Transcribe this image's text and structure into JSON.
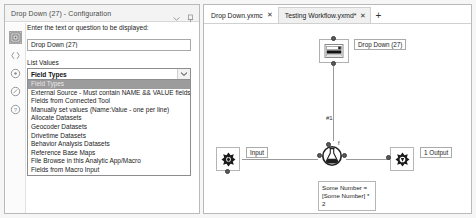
{
  "config_panel": {
    "header_title": "Drop Down (27) - Configuration",
    "header_icons": [
      "chevron-down-icon",
      "pin-icon"
    ],
    "rail_items": [
      {
        "name": "configuration-icon",
        "active": true
      },
      {
        "name": "annotation-icon",
        "active": false
      },
      {
        "name": "interface-designer-icon",
        "active": false
      },
      {
        "name": "output-icon",
        "active": false
      },
      {
        "name": "help-icon",
        "active": false
      }
    ],
    "prompt_label": "Enter the text or question to be displayed:",
    "prompt_value": "Drop Down (27)",
    "prompt_placeholder": "Enter the text or question to be displayed",
    "list_values_label": "List Values",
    "combo_selected": "Field Types",
    "combo_options": [
      "Field Types",
      "External Source - Must contain NAME && VALUE fields",
      "Fields from Connected Tool",
      "Manually set values (Name:Value - one per line)",
      "Allocate Datasets",
      "Geocoder Datasets",
      "Drivetime Datasets",
      "Behavior Analysis Datasets",
      "Reference Base Maps",
      "File Browse in this Analytic App/Macro",
      "Fields from Macro Input"
    ],
    "highlighted_option_index": 0
  },
  "canvas_panel": {
    "tabs": [
      {
        "label": "Drop Down.yxmc",
        "close": "✕",
        "active": false
      },
      {
        "label": "Testing Workflow.yxmd*",
        "close": "✕",
        "active": true
      }
    ],
    "add_tab": "+",
    "nodes": {
      "dropdown_tool_label": "Drop Down (27)",
      "connection_label": "#1",
      "macro_input_label": "Input",
      "macro_output_label": "1 Output",
      "formula_annotation": "Some Number = [Some Number] * 2"
    }
  },
  "colors": {
    "panel_border": "#b9b9b9",
    "header_bg": "#f3f3f3",
    "selected_option_bg": "#9c9c9c",
    "canvas_bg": "#ffffff",
    "connector": "#9a9a9a"
  }
}
